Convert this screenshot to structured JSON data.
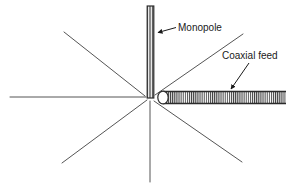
{
  "figure": {
    "background_color": "#ffffff",
    "line_color": "#2b2b2b",
    "radial_line_color": "#555555",
    "text_color": "#1a1a1a",
    "hatch_color": "#3a3a3a",
    "width": 299,
    "height": 185
  },
  "labels": {
    "monopole": "Monopole",
    "coaxial_feed": "Coaxial feed"
  },
  "elements": {
    "monopole_label_x": 178,
    "monopole_label_y": 31,
    "coaxial_label_x": 222,
    "coaxial_label_y": 72,
    "feed_point_x": 150,
    "feed_point_y": 97
  },
  "geometry": {
    "monopole": {
      "x_left": 147,
      "x_right": 154,
      "y_top": 6,
      "y_bottom": 97
    },
    "coax": {
      "x_start": 160,
      "x_end": 286,
      "y_top": 92,
      "y_bottom": 105,
      "cap_cx": 163,
      "cap_rx": 5,
      "cap_ry": 7
    },
    "radials": [
      {
        "name": "radial-left-horizontal",
        "x1": 10,
        "y1": 97,
        "x2": 146,
        "y2": 97
      },
      {
        "name": "radial-upper-left",
        "x1": 64,
        "y1": 32,
        "x2": 146,
        "y2": 96
      },
      {
        "name": "radial-lower-left",
        "x1": 62,
        "y1": 163,
        "x2": 148,
        "y2": 99
      },
      {
        "name": "radial-down-vertical",
        "x1": 150,
        "y1": 100,
        "x2": 150,
        "y2": 182
      },
      {
        "name": "radial-lower-right",
        "x1": 152,
        "y1": 100,
        "x2": 242,
        "y2": 162
      },
      {
        "name": "radial-upper-right",
        "x1": 152,
        "y1": 95,
        "x2": 243,
        "y2": 34
      }
    ],
    "leaders": [
      {
        "name": "monopole-leader",
        "x1": 175,
        "y1": 28,
        "x2": 157,
        "y2": 33
      },
      {
        "name": "coax-leader",
        "x1": 248,
        "y1": 63,
        "x2": 230,
        "y2": 89
      }
    ]
  }
}
